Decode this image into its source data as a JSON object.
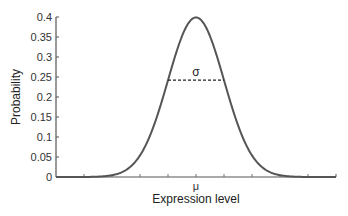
{
  "chart_data": {
    "type": "line",
    "title": "",
    "xlabel": "Expression level",
    "ylabel": "Probability",
    "xlim": [
      0,
      10
    ],
    "ylim": [
      0,
      0.4
    ],
    "yticks": [
      0,
      0.05,
      0.1,
      0.15,
      0.2,
      0.25,
      0.3,
      0.35,
      0.4
    ],
    "ytick_labels": [
      "0",
      "0.05",
      "0.1",
      "0.15",
      "0.2",
      "0.25",
      "0.3",
      "0.35",
      "0.4"
    ],
    "xticks": [
      1,
      2,
      3,
      4,
      5,
      6,
      7,
      8,
      9
    ],
    "xtick_labels": {
      "5": "μ"
    },
    "grid": false,
    "series": [
      {
        "name": "Normal distribution",
        "mean": 5,
        "std": 1,
        "color": "#555555",
        "x": [
          0,
          1,
          2,
          3,
          3.5,
          4,
          4.5,
          5,
          5.5,
          6,
          6.5,
          7,
          8,
          9,
          10
        ],
        "values": [
          1.5e-06,
          0.0001,
          0.0044,
          0.054,
          0.1295,
          0.242,
          0.352,
          0.399,
          0.352,
          0.242,
          0.1295,
          0.054,
          0.0044,
          0.0001,
          1.5e-06
        ]
      }
    ],
    "annotations": [
      {
        "type": "dashed-line",
        "x": [
          4,
          6
        ],
        "y": 0.242,
        "label": "σ"
      }
    ]
  }
}
